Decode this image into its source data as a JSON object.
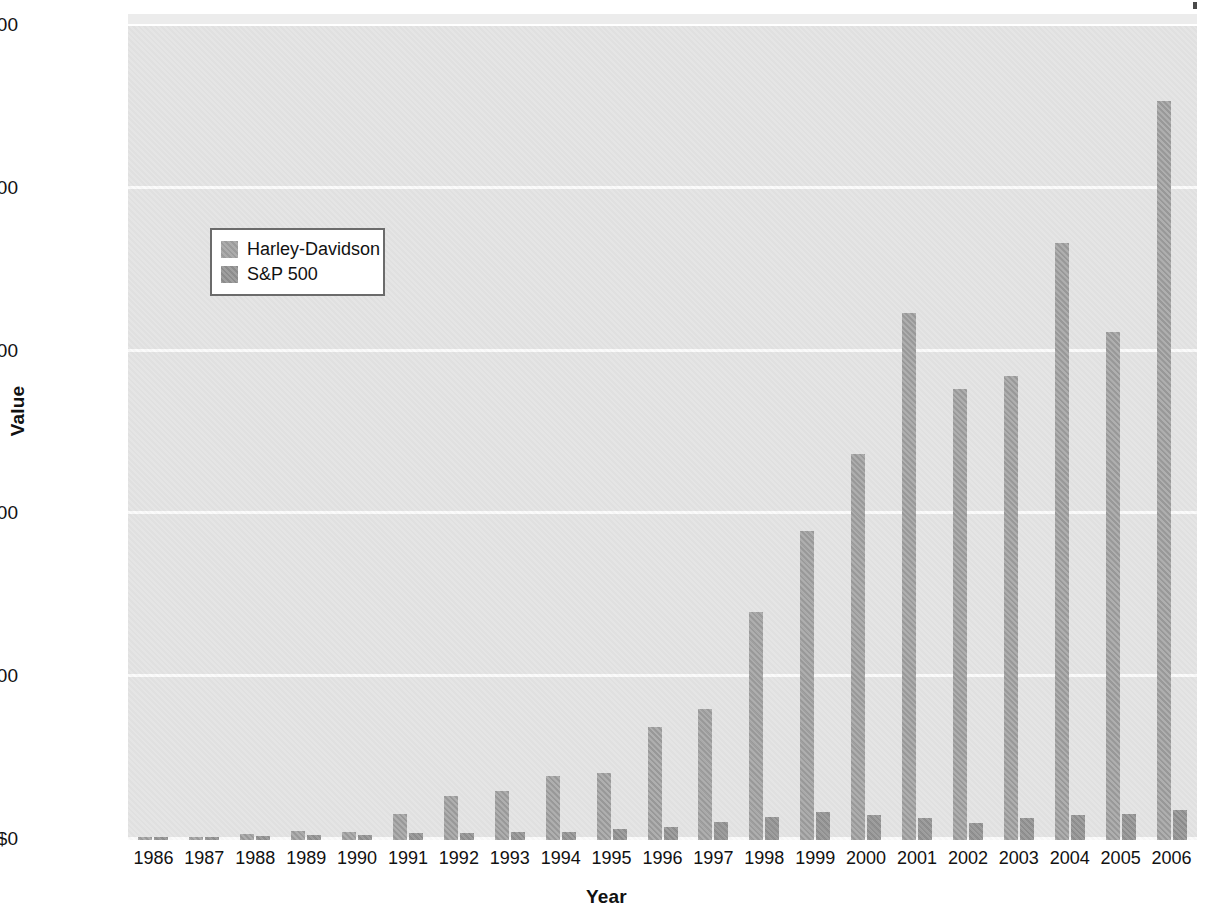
{
  "chart_data": {
    "type": "bar",
    "title": "",
    "xlabel": "Year",
    "ylabel": "Value",
    "categories": [
      "1986",
      "1987",
      "1988",
      "1989",
      "1990",
      "1991",
      "1992",
      "1993",
      "1994",
      "1995",
      "1996",
      "1997",
      "1998",
      "1999",
      "2000",
      "2001",
      "2002",
      "2003",
      "2004",
      "2005",
      "2006"
    ],
    "series": [
      {
        "name": "Harley-Davidson",
        "color": "#a3a3a3",
        "values": [
          100,
          105,
          190,
          290,
          245,
          800,
          1360,
          1520,
          1960,
          2060,
          3480,
          4020,
          7010,
          9500,
          11850,
          16200,
          13850,
          14250,
          18350,
          15600,
          22700
        ]
      },
      {
        "name": "S&P 500",
        "color": "#989898",
        "values": [
          100,
          105,
          122,
          161,
          156,
          203,
          219,
          241,
          244,
          336,
          413,
          551,
          709,
          858,
          780,
          688,
          536,
          690,
          765,
          802,
          929
        ]
      }
    ],
    "ylim": [
      0,
      25000
    ],
    "yticks": [
      0,
      5000,
      10000,
      15000,
      20000,
      25000
    ],
    "ytick_labels": [
      "$0",
      "$5,000",
      "$10,000",
      "$15,000",
      "$20,000",
      "$25,000"
    ],
    "grid": true,
    "grid_color": "#fbfbfb",
    "plot_background": "#e4e4e4",
    "legend": {
      "position": "upper-left-inside",
      "entries": [
        {
          "label": "Harley-Davidson",
          "swatch": "hd"
        },
        {
          "label": "S&P 500",
          "swatch": "sp"
        }
      ]
    }
  }
}
